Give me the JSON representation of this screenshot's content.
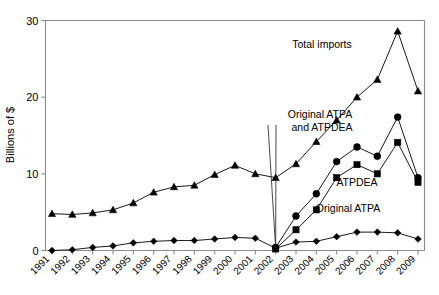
{
  "chart_data": {
    "type": "line",
    "title": "",
    "xlabel": "",
    "ylabel": "Billions of $",
    "ylim": [
      0,
      30
    ],
    "yticks": [
      0,
      10,
      20,
      30
    ],
    "grid": false,
    "legend_position": "inline-annotations",
    "categories": [
      "1991",
      "1992",
      "1993",
      "1994",
      "1995",
      "1996",
      "1997",
      "1998",
      "1999",
      "2000",
      "2001",
      "2002",
      "2003",
      "2004",
      "2005",
      "2006",
      "2007",
      "2008",
      "2009"
    ],
    "series": [
      {
        "name": "Total imports",
        "marker": "triangle",
        "values": [
          4.8,
          4.7,
          4.9,
          5.3,
          6.2,
          7.6,
          8.3,
          8.5,
          9.9,
          11.1,
          10.0,
          9.5,
          11.3,
          14.2,
          17.0,
          20.0,
          22.3,
          28.6,
          20.8
        ]
      },
      {
        "name": "Original ATPA and ATPDEA",
        "marker": "circle",
        "values": [
          null,
          null,
          null,
          null,
          null,
          null,
          null,
          null,
          null,
          null,
          null,
          0.4,
          4.5,
          7.4,
          11.6,
          13.5,
          12.3,
          17.4,
          9.5
        ]
      },
      {
        "name": "ATPDEA",
        "marker": "square",
        "values": [
          null,
          null,
          null,
          null,
          null,
          null,
          null,
          null,
          null,
          null,
          null,
          0.2,
          2.7,
          5.3,
          9.5,
          11.2,
          10.0,
          14.1,
          8.9
        ]
      },
      {
        "name": "Original ATPA",
        "marker": "diamond",
        "values": [
          0.0,
          0.1,
          0.4,
          0.6,
          1.0,
          1.2,
          1.3,
          1.3,
          1.5,
          1.7,
          1.6,
          0.3,
          1.1,
          1.2,
          1.8,
          2.4,
          2.4,
          2.3,
          1.5
        ]
      }
    ],
    "annotations": [
      {
        "text": "Total imports",
        "x": 322,
        "y": 48
      },
      {
        "text": "Original ATPA",
        "x": 320,
        "y": 118
      },
      {
        "text": "and ATPDEA",
        "x": 322,
        "y": 131
      },
      {
        "text": "ATPDEA",
        "x": 357,
        "y": 186
      },
      {
        "text": "Original ATPA",
        "x": 348,
        "y": 212
      }
    ]
  },
  "axes": {
    "y_tick_labels": [
      "30",
      "20",
      "10",
      "0"
    ],
    "y_axis_title": "Billions of $",
    "x_tick_labels": [
      "1991",
      "1992",
      "1993",
      "1994",
      "1995",
      "1996",
      "1997",
      "1998",
      "1999",
      "2000",
      "2001",
      "2002",
      "2003",
      "2004",
      "2005",
      "2006",
      "2007",
      "2008",
      "2009"
    ]
  },
  "colors": {
    "axis": "#808080",
    "line": "#1a1a1a",
    "marker": "#000000",
    "background": "#ffffff"
  }
}
